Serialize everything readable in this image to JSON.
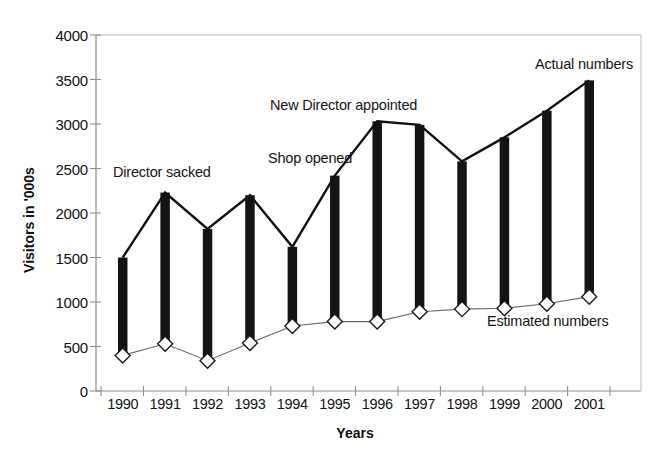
{
  "chart_data": {
    "type": "bar",
    "title": "",
    "subtitle": "",
    "xlabel": "Years",
    "ylabel": "Visitors in '000s",
    "categories": [
      "1990",
      "1991",
      "1992",
      "1993",
      "1994",
      "1995",
      "1996",
      "1997",
      "1998",
      "1999",
      "2000",
      "2001"
    ],
    "series": [
      {
        "name": "Actual numbers",
        "values": [
          1500,
          2230,
          1820,
          2200,
          1620,
          2420,
          3030,
          2990,
          2580,
          2850,
          3150,
          3490
        ]
      },
      {
        "name": "Estimated numbers",
        "values": [
          400,
          530,
          340,
          540,
          730,
          780,
          780,
          890,
          920,
          930,
          980,
          1060
        ]
      }
    ],
    "ylim": [
      0,
      4000
    ],
    "yticks": [
      0,
      500,
      1000,
      1500,
      2000,
      2500,
      3000,
      3500,
      4000
    ],
    "ytick_labels": [
      "0",
      "500",
      "1000",
      "1500",
      "2000",
      "2500",
      "3000",
      "3500",
      "4000"
    ],
    "grid": false,
    "legend": "inline-annotations",
    "annotations": [
      {
        "id": "director-sacked",
        "text": "Director sacked"
      },
      {
        "id": "shop-opened",
        "text": "Shop opened"
      },
      {
        "id": "new-director",
        "text": "New Director appointed"
      },
      {
        "id": "actual-numbers",
        "text": "Actual numbers"
      },
      {
        "id": "estimated-numbers",
        "text": "Estimated numbers"
      }
    ],
    "colors": {
      "bar_fill": "#141414",
      "actual_line": "#111111",
      "estimated_line": "#555555",
      "marker_fill": "#ffffff",
      "marker_stroke": "#1a1a1a",
      "axis": "#8a8a8a",
      "text": "#141414"
    }
  }
}
